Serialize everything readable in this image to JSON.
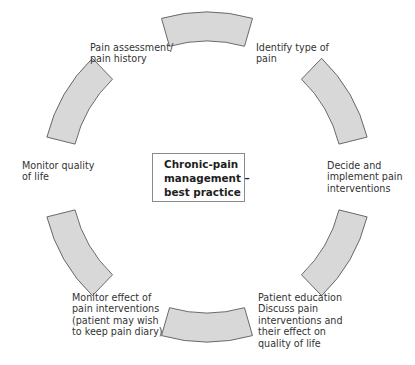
{
  "diagram": {
    "title_lines": [
      "Chronic-pain",
      "management –",
      "best practice"
    ],
    "style": {
      "arc_fill": "#d8d8d8",
      "arc_stroke": "#5a5a5a",
      "box_border": "#8a8a8a",
      "text_color": "#333333"
    },
    "cycle": {
      "center": [
        207,
        177
      ],
      "outer_radius": 165,
      "inner_radius": 136,
      "segment_half_span_deg": 16,
      "segment_angles_deg": [
        0,
        60,
        120,
        180,
        240,
        300
      ]
    },
    "steps": [
      {
        "id": "pain-assessment",
        "lines": [
          "Pain assessment/",
          "pain history"
        ]
      },
      {
        "id": "identify-type",
        "lines": [
          "Identify type of",
          "pain"
        ]
      },
      {
        "id": "decide-implement",
        "lines": [
          "Decide and",
          "implement pain",
          "interventions"
        ]
      },
      {
        "id": "patient-education",
        "lines": [
          "Patient education",
          "Discuss pain",
          "interventions and",
          "their effect on",
          "quality of life"
        ]
      },
      {
        "id": "monitor-effect",
        "lines": [
          "Monitor effect of",
          "pain interventions",
          "(patient may wish",
          "to keep pain diary)"
        ]
      },
      {
        "id": "monitor-quality",
        "lines": [
          "Monitor quality",
          "of life"
        ]
      }
    ]
  }
}
